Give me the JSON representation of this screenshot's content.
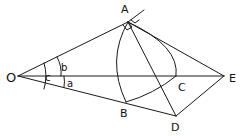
{
  "colors": {
    "stroke": "#1a1a1a",
    "background": "#ffffff"
  },
  "points": {
    "O": {
      "label": "O",
      "x": 18,
      "y": 76,
      "lx": 6,
      "ly": 82
    },
    "A": {
      "label": "A",
      "x": 128,
      "y": 22,
      "lx": 121,
      "ly": 13
    },
    "B": {
      "label": "B",
      "x": 126,
      "y": 102,
      "lx": 120,
      "ly": 117
    },
    "C": {
      "label": "C",
      "x": 176,
      "y": 76,
      "lx": 178,
      "ly": 91
    },
    "D": {
      "label": "D",
      "x": 176,
      "y": 116,
      "lx": 171,
      "ly": 131
    },
    "E": {
      "label": "E",
      "x": 224,
      "y": 76,
      "lx": 229,
      "ly": 82
    }
  },
  "angles": {
    "a": {
      "label": "a",
      "lx": 67,
      "ly": 87
    },
    "b": {
      "label": "b",
      "lx": 62,
      "ly": 71
    },
    "c": {
      "label": "c",
      "lx": 44,
      "ly": 81
    }
  }
}
